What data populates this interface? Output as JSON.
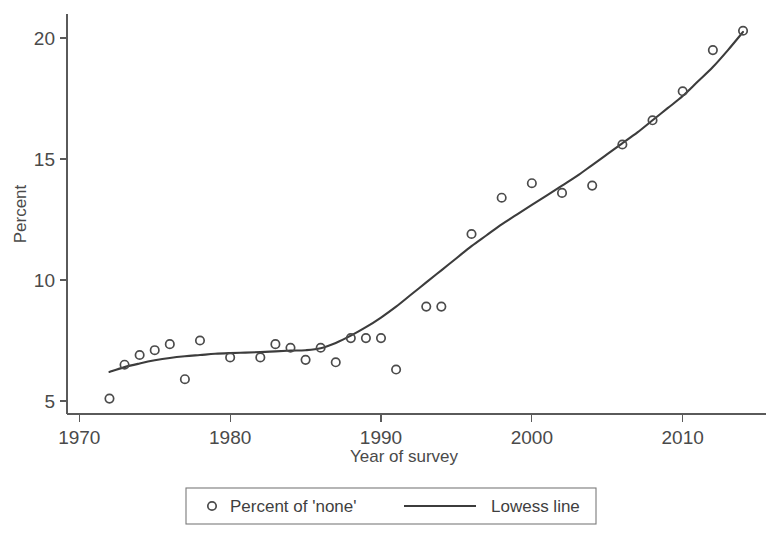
{
  "chart_data": {
    "type": "scatter",
    "title": "",
    "xlabel": "Year of survey",
    "ylabel": "Percent",
    "xlim": [
      1970.0,
      2015.5
    ],
    "ylim": [
      4.3,
      20.9
    ],
    "xticks": [
      1970,
      1980,
      1990,
      2000,
      2010
    ],
    "xtick_labels": [
      "1970",
      "1980",
      "1990",
      "2000",
      "2010"
    ],
    "yticks": [
      5,
      10,
      15,
      20
    ],
    "ytick_labels": [
      "5",
      "10",
      "15",
      "20"
    ],
    "grid": false,
    "legend_position": "bottom-center",
    "series": [
      {
        "name": "Percent of 'none'",
        "type": "scatter",
        "marker": "open-circle",
        "color": "#4b4b4b",
        "x": [
          1972,
          1973,
          1974,
          1975,
          1976,
          1977,
          1978,
          1980,
          1982,
          1983,
          1984,
          1985,
          1986,
          1987,
          1988,
          1989,
          1990,
          1991,
          1993,
          1994,
          1996,
          1998,
          2000,
          2002,
          2004,
          2006,
          2008,
          2010,
          2012,
          2014
        ],
        "y": [
          5.1,
          6.5,
          6.9,
          7.1,
          7.35,
          5.9,
          7.5,
          6.8,
          6.8,
          7.35,
          7.2,
          6.7,
          7.2,
          6.6,
          7.6,
          7.6,
          7.6,
          6.3,
          8.9,
          8.9,
          11.9,
          13.4,
          14.0,
          13.6,
          13.9,
          15.6,
          16.6,
          17.8,
          19.5,
          20.3
        ]
      },
      {
        "name": "Lowess line",
        "type": "line",
        "color": "#3c3c3c",
        "x": [
          1972,
          1973,
          1974,
          1975,
          1976,
          1977,
          1978,
          1979,
          1980,
          1981,
          1982,
          1983,
          1984,
          1985,
          1986,
          1987,
          1988,
          1989,
          1990,
          1991,
          1992,
          1993,
          1994,
          1995,
          1996,
          1997,
          1998,
          1999,
          2000,
          2001,
          2002,
          2003,
          2004,
          2005,
          2006,
          2007,
          2008,
          2009,
          2010,
          2011,
          2012,
          2013,
          2014
        ],
        "y": [
          6.2,
          6.4,
          6.55,
          6.68,
          6.78,
          6.85,
          6.9,
          6.95,
          6.98,
          7.0,
          7.02,
          7.05,
          7.08,
          7.1,
          7.18,
          7.4,
          7.7,
          8.05,
          8.45,
          8.9,
          9.4,
          9.9,
          10.4,
          10.9,
          11.4,
          11.85,
          12.3,
          12.7,
          13.1,
          13.5,
          13.9,
          14.3,
          14.75,
          15.2,
          15.65,
          16.1,
          16.6,
          17.1,
          17.6,
          18.2,
          18.8,
          19.5,
          20.25
        ]
      }
    ]
  },
  "legend": {
    "entries": [
      {
        "label": "Percent of 'none'",
        "symbol": "open-circle"
      },
      {
        "label": "Lowess line",
        "symbol": "line"
      }
    ]
  }
}
